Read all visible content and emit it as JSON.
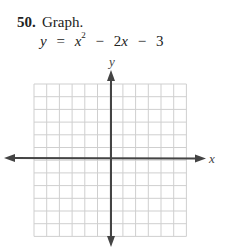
{
  "problem": {
    "number": "50.",
    "instruction": "Graph.",
    "equation": {
      "lhs": "y",
      "eq": "=",
      "term1_base": "x",
      "term1_exp": "2",
      "op1": "−",
      "term2": "2x",
      "op2": "−",
      "term3": "3"
    }
  },
  "graph": {
    "x_axis_label": "x",
    "y_axis_label": "y",
    "grid_cols": 12,
    "grid_rows": 12,
    "grid_color": "#cfcfcf",
    "axis_color": "#444444"
  }
}
